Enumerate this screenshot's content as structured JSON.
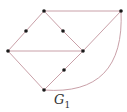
{
  "graph": {
    "label": "G",
    "label_subscript": "1",
    "edge_color": "#c9a0a8",
    "node_color": "#1a1a1a",
    "nodes": [
      {
        "id": "A",
        "x": 44,
        "y": 11
      },
      {
        "id": "B",
        "x": 121,
        "y": 11
      },
      {
        "id": "C",
        "x": 8,
        "y": 51
      },
      {
        "id": "D",
        "x": 83,
        "y": 51
      },
      {
        "id": "E",
        "x": 44,
        "y": 90
      },
      {
        "id": "M1",
        "x": 26,
        "y": 31
      },
      {
        "id": "M2",
        "x": 63,
        "y": 31
      },
      {
        "id": "M3",
        "x": 64,
        "y": 70
      }
    ],
    "edges": [
      {
        "from": "A",
        "to": "B"
      },
      {
        "from": "A",
        "to": "M1"
      },
      {
        "from": "M1",
        "to": "C"
      },
      {
        "from": "A",
        "to": "M2"
      },
      {
        "from": "M2",
        "to": "D"
      },
      {
        "from": "C",
        "to": "D"
      },
      {
        "from": "C",
        "to": "E"
      },
      {
        "from": "E",
        "to": "M3"
      },
      {
        "from": "M3",
        "to": "D"
      },
      {
        "from": "D",
        "to": "B"
      },
      {
        "from": "B",
        "to": "E",
        "curved": true
      }
    ]
  }
}
